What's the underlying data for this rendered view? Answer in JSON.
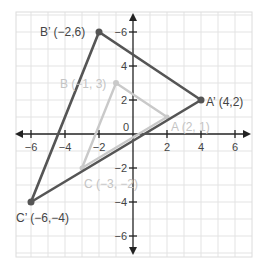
{
  "diagram": {
    "type": "coordinate-plane-dilation",
    "colors": {
      "grid": "#e3e3e3",
      "axis": "#222222",
      "image_triangle": "#555555",
      "preimage_triangle": "#c9c9c9",
      "image_text": "#444444",
      "preimage_text": "#c4c4c4"
    },
    "x_ticks": [
      "−6",
      "−4",
      "−2",
      "2",
      "4",
      "6"
    ],
    "y_ticks": [
      "−6",
      "4",
      "2",
      "−2",
      "−4",
      "−6"
    ],
    "origin_label": "0",
    "preimage": {
      "A": {
        "label": "A (2, 1)",
        "x": 2,
        "y": 1
      },
      "B": {
        "label": "B (−1, 3)",
        "x": -1,
        "y": 3
      },
      "C": {
        "label": "C (−3, −2)",
        "x": -3,
        "y": -2
      }
    },
    "image": {
      "A": {
        "label": "A’ (4,2)",
        "x": 4,
        "y": 2
      },
      "B": {
        "label": "B’ (−2,6)",
        "x": -2,
        "y": 6
      },
      "C": {
        "label": "C’ (−6,−4)",
        "x": -6,
        "y": -4
      }
    }
  }
}
